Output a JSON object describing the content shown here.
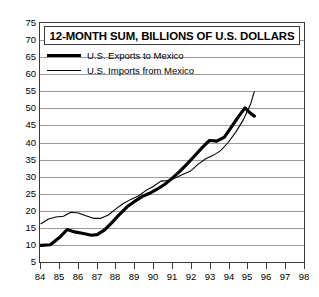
{
  "chart_data": {
    "type": "line",
    "title": "12-MONTH SUM, BILLIONS OF U.S. DOLLARS",
    "xlabel": "",
    "ylabel": "",
    "xlim": [
      84,
      98
    ],
    "ylim": [
      5,
      75
    ],
    "ytick_step": 5,
    "grid": true,
    "legend_position": "top-left-inside",
    "yticks": [
      75,
      70,
      65,
      60,
      55,
      50,
      45,
      40,
      35,
      30,
      25,
      20,
      15,
      10,
      5
    ],
    "xticks": [
      "84",
      "85",
      "86",
      "87",
      "88",
      "89",
      "90",
      "91",
      "92",
      "93",
      "94",
      "95",
      "96",
      "97",
      "98"
    ],
    "series": [
      {
        "name": "U.S. Exports to Mexico",
        "style": "thick",
        "color": "#000000",
        "x": [
          84.0,
          84.5,
          85.0,
          85.4,
          85.8,
          86.2,
          86.7,
          87.0,
          87.4,
          87.8,
          88.2,
          88.6,
          89.0,
          89.4,
          89.8,
          90.2,
          90.6,
          91.0,
          91.4,
          91.8,
          92.2,
          92.6,
          93.0,
          93.4,
          93.8,
          94.2,
          94.6,
          94.9,
          95.2,
          95.4
        ],
        "y": [
          9.6,
          9.8,
          12.0,
          14.3,
          13.6,
          13.2,
          12.6,
          12.8,
          14.2,
          16.4,
          18.8,
          21.0,
          22.6,
          24.0,
          25.0,
          26.2,
          27.6,
          29.4,
          31.4,
          33.6,
          36.0,
          38.4,
          40.6,
          40.4,
          41.6,
          44.8,
          48.0,
          50.2,
          48.6,
          47.8
        ]
      },
      {
        "name": "U.S. Imports from Mexico",
        "style": "thin",
        "color": "#000000",
        "x": [
          84.0,
          84.4,
          84.8,
          85.2,
          85.6,
          86.0,
          86.4,
          86.8,
          87.2,
          87.6,
          88.0,
          88.4,
          88.8,
          89.2,
          89.6,
          90.0,
          90.4,
          90.8,
          91.2,
          91.6,
          92.0,
          92.4,
          92.8,
          93.2,
          93.6,
          94.0,
          94.4,
          94.8,
          95.2,
          95.4
        ],
        "y": [
          16.0,
          17.4,
          18.0,
          18.2,
          19.4,
          19.2,
          18.4,
          17.6,
          17.6,
          18.6,
          20.4,
          22.0,
          23.2,
          24.2,
          25.8,
          27.0,
          28.6,
          28.8,
          29.6,
          30.6,
          31.6,
          33.6,
          35.2,
          36.2,
          37.6,
          40.0,
          43.0,
          46.6,
          51.4,
          55.0
        ]
      }
    ]
  },
  "legend": {
    "items": [
      {
        "label": "U.S. Exports to Mexico",
        "style": "thick"
      },
      {
        "label": "U.S. Imports from Mexico",
        "style": "thin"
      }
    ]
  }
}
